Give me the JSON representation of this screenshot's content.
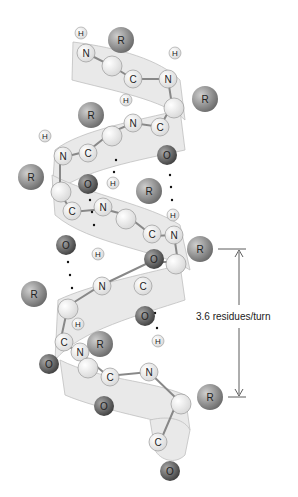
{
  "diagram": {
    "type": "alpha-helix",
    "annotation": "3.6 residues/turn",
    "atom_labels": {
      "nitrogen": "N",
      "carbon": "C",
      "oxygen": "O",
      "hydrogen": "H",
      "side_chain": "R"
    },
    "colors": {
      "ribbon": "#e4e4e4",
      "ribbon_stroke": "#b8b8b8",
      "side_chain": "#8a8a8a",
      "oxygen": "#6a6a6a",
      "backbone_atom": "#f4f4f4",
      "hbond_dots": "#111111"
    }
  }
}
